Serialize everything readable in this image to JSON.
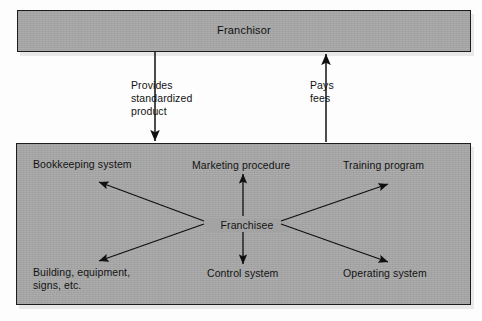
{
  "diagram": {
    "type": "franchise-relationship-flowchart",
    "background_color": "#fdfdfd",
    "box_fill_color": "#a3a3a3",
    "line_color": "#101010",
    "top_node": {
      "label": "Franchisor"
    },
    "center_node": {
      "label": "Franchisee"
    },
    "connectors": [
      {
        "id": "provides-standardized-product",
        "label_lines": [
          "Provides",
          "standardized",
          "product"
        ],
        "direction": "down",
        "from": "Franchisor",
        "to": "Franchisee"
      },
      {
        "id": "pays-fees",
        "label_lines": [
          "Pays",
          "fees"
        ],
        "direction": "up",
        "from": "Franchisee",
        "to": "Franchisor"
      }
    ],
    "franchisee_items": [
      {
        "id": "bookkeeping-system",
        "label_lines": [
          "Bookkeeping system"
        ],
        "position": "top-left"
      },
      {
        "id": "marketing-procedure",
        "label_lines": [
          "Marketing procedure"
        ],
        "position": "top-center"
      },
      {
        "id": "training-program",
        "label_lines": [
          "Training program"
        ],
        "position": "top-right"
      },
      {
        "id": "building-equipment-signs",
        "label_lines": [
          "Building, equipment,",
          "signs, etc."
        ],
        "position": "bottom-left"
      },
      {
        "id": "control-system",
        "label_lines": [
          "Control system"
        ],
        "position": "bottom-center"
      },
      {
        "id": "operating-system",
        "label_lines": [
          "Operating system"
        ],
        "position": "bottom-right"
      }
    ]
  }
}
